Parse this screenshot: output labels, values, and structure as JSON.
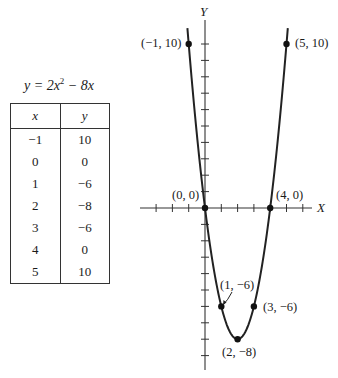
{
  "table": {
    "equation": {
      "lhs": "y",
      "eq": " = 2x",
      "exp": "2",
      "rest": " − 8x"
    },
    "headers": [
      "x",
      "y"
    ],
    "rows": [
      [
        "−1",
        "10"
      ],
      [
        "0",
        "0"
      ],
      [
        "1",
        "−6"
      ],
      [
        "2",
        "−8"
      ],
      [
        "3",
        "−6"
      ],
      [
        "4",
        "0"
      ],
      [
        "5",
        "10"
      ]
    ]
  },
  "chart_data": {
    "type": "line",
    "xlabel": "X",
    "ylabel": "Y",
    "x": [
      -1,
      0,
      1,
      2,
      3,
      4,
      5
    ],
    "series": [
      {
        "name": "y = 2x² − 8x",
        "values": [
          10,
          0,
          -6,
          -8,
          -6,
          0,
          10
        ]
      }
    ],
    "points": [
      {
        "x": -1,
        "y": 10,
        "label": "(−1, 10)"
      },
      {
        "x": 5,
        "y": 10,
        "label": "(5, 10)"
      },
      {
        "x": 0,
        "y": 0,
        "label": "(0, 0)"
      },
      {
        "x": 4,
        "y": 0,
        "label": "(4, 0)"
      },
      {
        "x": 1,
        "y": -6,
        "label": "(1, −6)"
      },
      {
        "x": 3,
        "y": -6,
        "label": "(3, −6)"
      },
      {
        "x": 2,
        "y": -8,
        "label": "(2, −8)"
      }
    ],
    "xlim": [
      -3,
      6
    ],
    "ylim": [
      -10,
      11
    ],
    "x_ticks": [
      -3,
      -2,
      -1,
      1,
      2,
      3,
      4,
      5,
      6
    ],
    "y_ticks": [
      -9,
      -8,
      -7,
      -6,
      -5,
      -4,
      -3,
      -2,
      -1,
      1,
      2,
      3,
      4,
      5,
      6,
      7,
      8,
      9,
      10
    ],
    "grid": false,
    "legend": "none"
  },
  "labels": {
    "x_axis": "X",
    "y_axis": "Y",
    "p_m1_10": "(−1, 10)",
    "p_5_10": "(5, 10)",
    "p_0_0": "(0, 0)",
    "p_4_0": "(4, 0)",
    "p_1_m6": "(1, −6)",
    "p_3_m6": "(3, −6)",
    "p_2_m8": "(2, −8)"
  }
}
